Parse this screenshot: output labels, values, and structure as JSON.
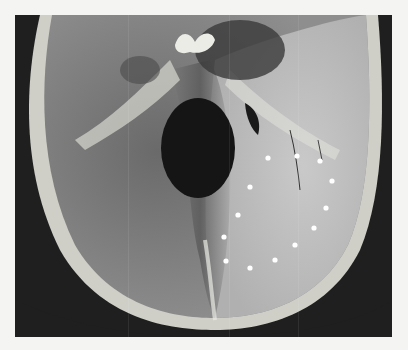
{
  "image": {
    "subject": "skull base specimen, superior view",
    "style": "grayscale photograph",
    "background_color": "#1f1f1f",
    "frame_color": "#f4f4f2",
    "marker_color": "#ffffff",
    "markers": [
      {
        "x": 268,
        "y": 158
      },
      {
        "x": 297,
        "y": 156
      },
      {
        "x": 320,
        "y": 161
      },
      {
        "x": 332,
        "y": 181
      },
      {
        "x": 326,
        "y": 208
      },
      {
        "x": 314,
        "y": 228
      },
      {
        "x": 295,
        "y": 245
      },
      {
        "x": 275,
        "y": 260
      },
      {
        "x": 250,
        "y": 268
      },
      {
        "x": 226,
        "y": 261
      },
      {
        "x": 224,
        "y": 237
      },
      {
        "x": 238,
        "y": 215
      },
      {
        "x": 250,
        "y": 187
      }
    ]
  }
}
